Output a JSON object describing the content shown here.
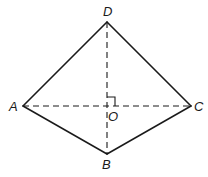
{
  "diagram": {
    "type": "quadrilateral-kite",
    "stroke_color": "#1a1a1a",
    "background": "#ffffff",
    "vertices": {
      "A": {
        "label": "A",
        "x": 23,
        "y": 106
      },
      "B": {
        "label": "B",
        "x": 107,
        "y": 154
      },
      "C": {
        "label": "C",
        "x": 191,
        "y": 106
      },
      "D": {
        "label": "D",
        "x": 107,
        "y": 22
      },
      "O": {
        "label": "O",
        "x": 107,
        "y": 106
      }
    },
    "edges": [
      {
        "from": "A",
        "to": "D",
        "style": "solid"
      },
      {
        "from": "D",
        "to": "C",
        "style": "solid"
      },
      {
        "from": "C",
        "to": "B",
        "style": "solid"
      },
      {
        "from": "B",
        "to": "A",
        "style": "solid"
      }
    ],
    "diagonals": [
      {
        "from": "A",
        "to": "C",
        "style": "dashed"
      },
      {
        "from": "D",
        "to": "B",
        "style": "dashed"
      }
    ],
    "annotations": [
      {
        "type": "right-angle",
        "at": "O",
        "between": [
          "O-C",
          "O-D"
        ]
      }
    ],
    "labels": {
      "A": "A",
      "B": "B",
      "C": "C",
      "D": "D",
      "O": "O"
    }
  }
}
